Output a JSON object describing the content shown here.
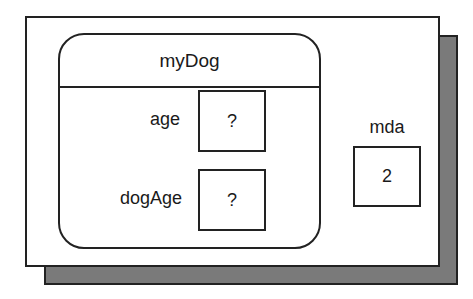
{
  "diagram": {
    "object": {
      "name": "myDog",
      "fields": [
        {
          "label": "age",
          "value": "?"
        },
        {
          "label": "dogAge",
          "value": "?"
        }
      ]
    },
    "variable": {
      "label": "mda",
      "value": "2"
    }
  },
  "colors": {
    "shadow": "#7a7a7a",
    "stroke": "#222222",
    "background": "#ffffff"
  }
}
